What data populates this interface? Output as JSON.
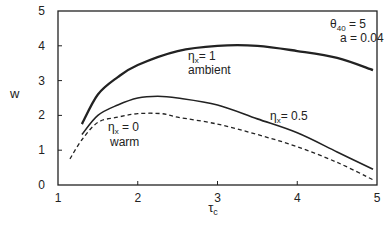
{
  "chart_data": {
    "type": "line",
    "title": "",
    "xlabel": "τc",
    "ylabel": "w",
    "xlim": [
      1,
      5
    ],
    "ylim": [
      0,
      5
    ],
    "x_ticks": [
      "1",
      "2",
      "3",
      "4",
      "5"
    ],
    "y_ticks": [
      "0",
      "1",
      "2",
      "3",
      "4",
      "5"
    ],
    "grid": false,
    "annotations": [
      "θ40 =   5",
      "a = 0.04"
    ],
    "series": [
      {
        "name": "ηx = 1",
        "sublabel": "ambient",
        "style": "solid-thick",
        "x": [
          1.3,
          1.5,
          1.75,
          2.0,
          2.5,
          3.0,
          3.5,
          4.0,
          4.5,
          4.95
        ],
        "y": [
          1.75,
          2.6,
          3.1,
          3.45,
          3.85,
          4.0,
          4.0,
          3.85,
          3.65,
          3.3
        ]
      },
      {
        "name": "ηx = 0.5",
        "sublabel": "",
        "style": "solid",
        "x": [
          1.3,
          1.5,
          1.75,
          2.0,
          2.25,
          2.5,
          3.0,
          3.5,
          4.0,
          4.5,
          4.95
        ],
        "y": [
          1.45,
          2.0,
          2.3,
          2.5,
          2.55,
          2.5,
          2.3,
          1.9,
          1.5,
          0.95,
          0.45
        ]
      },
      {
        "name": "ηx = 0",
        "sublabel": "warm",
        "style": "dashed",
        "x": [
          1.15,
          1.3,
          1.5,
          1.75,
          2.0,
          2.3,
          2.5,
          3.0,
          3.5,
          4.0,
          4.5,
          4.95
        ],
        "y": [
          0.75,
          1.3,
          1.8,
          1.95,
          2.05,
          2.05,
          1.95,
          1.75,
          1.45,
          1.1,
          0.65,
          0.15
        ]
      }
    ]
  }
}
